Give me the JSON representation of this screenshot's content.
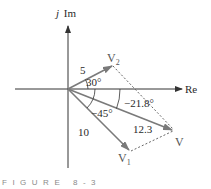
{
  "figure": {
    "caption": "FIGURE 8-3",
    "colors": {
      "axis": "#333333",
      "vector": "#7a7a7a",
      "dashed": "#555555",
      "text": "#2a2a2a",
      "caption": "#8a8a8a"
    }
  },
  "axes": {
    "imag_label_j": "j",
    "imag_label": "Im",
    "real_label": "Re"
  },
  "vectors": [
    {
      "id": "V2",
      "name": "V",
      "subscript": "2",
      "magnitude": "5",
      "angle": "30°"
    },
    {
      "id": "V1",
      "name": "V",
      "subscript": "1",
      "magnitude": "10",
      "angle": "−45°"
    },
    {
      "id": "V",
      "name": "V",
      "subscript": "",
      "magnitude": "12.3",
      "angle": "−21.8°"
    }
  ]
}
